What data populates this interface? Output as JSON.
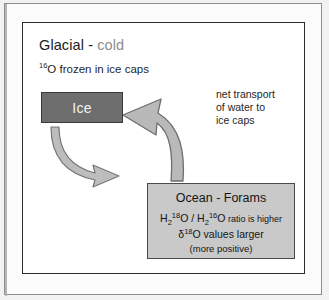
{
  "figure": {
    "title": {
      "main": "Glacial - ",
      "accent": "cold"
    },
    "subtitle": {
      "superscript": "16",
      "text": "O frozen in ice caps"
    },
    "ice_box": {
      "label": "Ice"
    },
    "caption": {
      "line1": "net transport",
      "line2": "of water to",
      "line3": "ice caps"
    },
    "ocean_box": {
      "title": "Ocean - Forams",
      "ratio": {
        "h": "H",
        "sub2": "2",
        "sup18": "18",
        "o": "O",
        "slash": " / ",
        "h2": "H",
        "sub2b": "2",
        "sup16": "16",
        "o2": "O",
        "tail": "  ratio is higher"
      },
      "delta": {
        "symbol": "δ",
        "superscript": "18",
        "text": "O values larger"
      },
      "note": "(more positive)"
    },
    "arrows": {
      "up_arrow_name": "net-transport-arrow",
      "down_arrow_name": "ice-to-ocean-arrow"
    },
    "colors": {
      "ice_fill": "#6e6e6e",
      "ocean_fill": "#c9c9c9",
      "arrow_fill": "#b9b9b9",
      "arrow_stroke": "#6a6a6a",
      "accent_text": "#8d8d8d",
      "panel_border": "#2b2b2b"
    }
  }
}
